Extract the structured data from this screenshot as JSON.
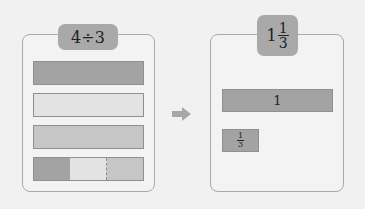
{
  "left_panel": {
    "title": "4÷3",
    "bars": [
      {
        "fill": "#a3a3a3",
        "label": "whole bar 1"
      },
      {
        "fill": "#e3e3e3",
        "label": "whole bar 2"
      },
      {
        "fill": "#c6c6c6",
        "label": "whole bar 3"
      }
    ],
    "split_bar": {
      "segments": [
        {
          "fill": "#a3a3a3"
        },
        {
          "fill": "#e3e3e3"
        },
        {
          "fill": "#c6c6c6"
        }
      ]
    }
  },
  "arrow": {
    "color": "#a8a8a8",
    "icon": "right-arrow-icon"
  },
  "right_panel": {
    "title": {
      "whole": "1",
      "numerator": "1",
      "denominator": "3"
    },
    "bar_one": {
      "label": "1",
      "fill": "#a3a3a3"
    },
    "bar_third": {
      "numerator": "1",
      "denominator": "3",
      "fill": "#a3a3a3"
    }
  },
  "colors": {
    "background": "#f1f1f1",
    "panel_border": "#a9a9a9",
    "badge": "#a9a9a9"
  }
}
